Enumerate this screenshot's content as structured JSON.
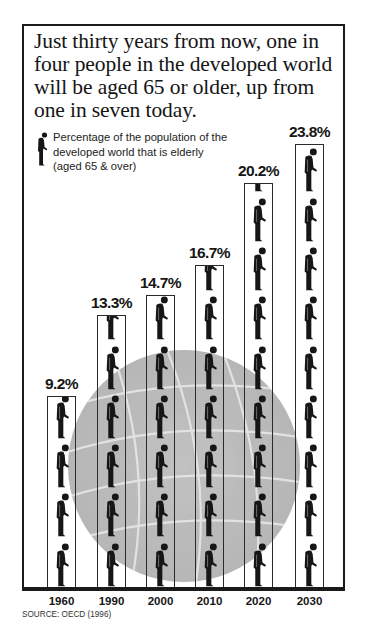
{
  "headline": "Just thirty years from now, one in four people in the developed world will be aged 65 or older, up from one in seven today.",
  "legend": {
    "icon": "elderly-person-icon",
    "text": "Percentage of the population of the developed world that is elderly (aged 65 & over)"
  },
  "source": "SOURCE: OECD (1996)",
  "chart_data": {
    "type": "bar",
    "title": "Just thirty years from now, one in four people in the developed world will be aged 65 or older, up from one in seven today.",
    "subtitle": "Percentage of the population of the developed world that is elderly (aged 65 & over)",
    "categories": [
      "1960",
      "1990",
      "2000",
      "2010",
      "2020",
      "2030"
    ],
    "values": [
      9.2,
      13.3,
      14.7,
      16.7,
      20.2,
      23.8
    ],
    "labels": [
      "9.2%",
      "13.3%",
      "14.7%",
      "16.7%",
      "20.2%",
      "23.8%"
    ],
    "xlabel": "",
    "ylabel": "Percentage aged 65 & over",
    "ylim": [
      0,
      25
    ],
    "grid": false,
    "legend_position": "top-left",
    "style": "pictograph (stacked elderly-person icons) over a globe background",
    "source": "OECD (1996)"
  },
  "columns": [
    {
      "year": "1960",
      "label": "9.2%",
      "left": 47,
      "top": 396
    },
    {
      "year": "1990",
      "label": "13.3%",
      "left": 97,
      "top": 315
    },
    {
      "year": "2000",
      "label": "14.7%",
      "left": 146,
      "top": 295
    },
    {
      "year": "2010",
      "label": "16.7%",
      "left": 195,
      "top": 265
    },
    {
      "year": "2020",
      "label": "20.2%",
      "left": 244,
      "top": 183
    },
    {
      "year": "2030",
      "label": "23.8%",
      "left": 295,
      "top": 144
    }
  ],
  "colors": {
    "ink": "#161616",
    "globe": "#ababab",
    "background": "#ffffff"
  }
}
